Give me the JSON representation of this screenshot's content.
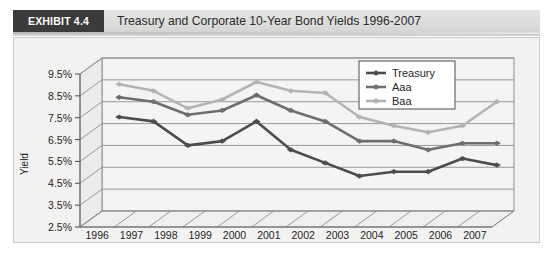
{
  "exhibit": {
    "badge_label": "EXHIBIT 4.4",
    "title": "Treasury and Corporate 10-Year Bond Yields 1996-2007"
  },
  "chart_data": {
    "type": "line",
    "title": "Treasury and Corporate 10-Year Bond Yields 1996-2007",
    "xlabel": "",
    "ylabel": "Yield",
    "categories": [
      "1996",
      "1997",
      "1998",
      "1999",
      "2000",
      "2001",
      "2002",
      "2003",
      "2004",
      "2005",
      "2006",
      "2007"
    ],
    "ylim": [
      2.5,
      9.5
    ],
    "ytick_labels": [
      "2.5%",
      "3.5%",
      "4.5%",
      "5.5%",
      "6.5%",
      "7.5%",
      "8.5%",
      "9.5%"
    ],
    "ytick_values": [
      2.5,
      3.5,
      4.5,
      5.5,
      6.5,
      7.5,
      8.5,
      9.5
    ],
    "grid": true,
    "legend_position": "top-right",
    "series": [
      {
        "name": "Treasury",
        "color": "#4d4d4d",
        "values": [
          6.8,
          6.6,
          5.5,
          5.7,
          6.6,
          5.3,
          4.7,
          4.1,
          4.3,
          4.3,
          4.9,
          4.6
        ]
      },
      {
        "name": "Aaa",
        "color": "#6e6e6e",
        "values": [
          7.7,
          7.5,
          6.9,
          7.1,
          7.8,
          7.1,
          6.6,
          5.7,
          5.7,
          5.3,
          5.6,
          5.6
        ]
      },
      {
        "name": "Baa",
        "color": "#b4b4b4",
        "values": [
          8.3,
          8.0,
          7.2,
          7.6,
          8.4,
          8.0,
          7.9,
          6.8,
          6.4,
          6.1,
          6.4,
          7.5
        ]
      }
    ]
  },
  "legend": {
    "entries": [
      {
        "label": "Treasury",
        "color": "#4d4d4d"
      },
      {
        "label": "Aaa",
        "color": "#6e6e6e"
      },
      {
        "label": "Baa",
        "color": "#b4b4b4"
      }
    ]
  }
}
